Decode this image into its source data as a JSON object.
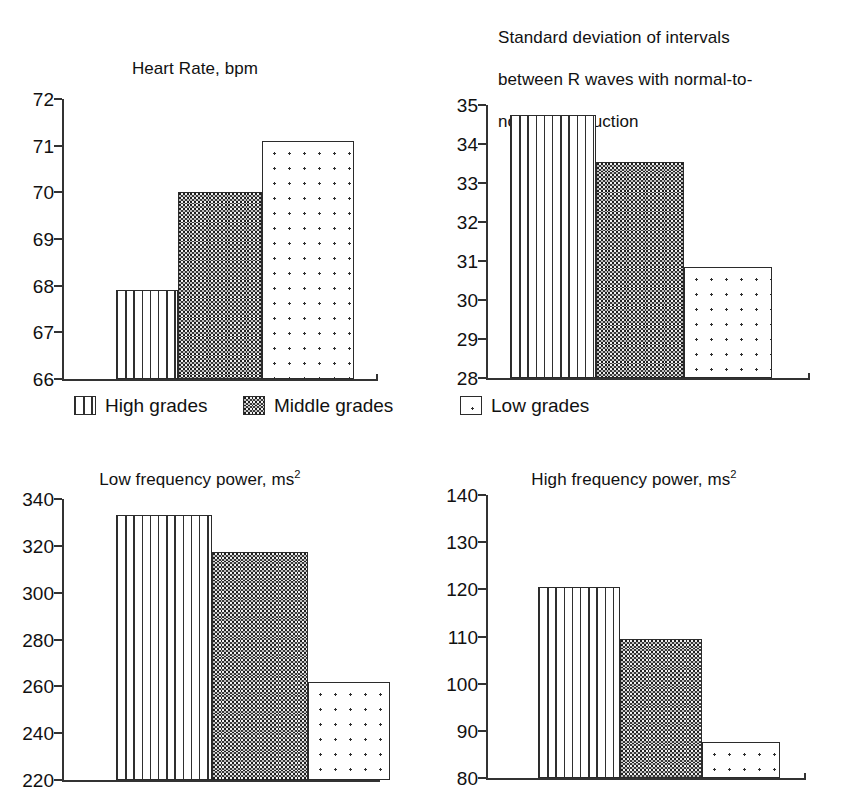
{
  "figure": {
    "legend": {
      "items": [
        {
          "label": "High grades",
          "pattern": "vertical-stripes"
        },
        {
          "label": "Middle grades",
          "pattern": "dark-checkerboard"
        },
        {
          "label": "Low grades",
          "pattern": "sparse-dots"
        }
      ]
    }
  },
  "chart_data": [
    {
      "id": "heart-rate",
      "type": "bar",
      "title": "Heart Rate, bpm",
      "title_plain": "Heart Rate, bpm",
      "xlabel": "",
      "ylabel": "",
      "ylim": [
        66,
        72
      ],
      "yticks": [
        72,
        71,
        70,
        69,
        68,
        67,
        66
      ],
      "grid": false,
      "categories": [
        "High grades",
        "Middle grades",
        "Low grades"
      ],
      "values": [
        67.9,
        70.0,
        71.1
      ]
    },
    {
      "id": "sdnn",
      "type": "bar",
      "title": "Standard deviation of intervals between R waves with normal-to-normal conduction",
      "title_lines": [
        "Standard deviation of intervals",
        "between R waves with normal-to-",
        "normal conduction"
      ],
      "xlabel": "",
      "ylabel": "",
      "ylim": [
        28,
        35
      ],
      "yticks": [
        35,
        34,
        33,
        32,
        31,
        30,
        29,
        28
      ],
      "grid": false,
      "categories": [
        "High grades",
        "Middle grades",
        "Low grades"
      ],
      "values": [
        34.75,
        33.55,
        30.85
      ]
    },
    {
      "id": "low-frequency-power",
      "type": "bar",
      "title": "Low frequency power, ms2",
      "title_prefix": "Low frequency power, ms",
      "title_superscript": "2",
      "xlabel": "",
      "ylabel": "",
      "ylim": [
        220,
        340
      ],
      "yticks": [
        340,
        320,
        300,
        280,
        260,
        240,
        220
      ],
      "grid": false,
      "categories": [
        "High grades",
        "Middle grades",
        "Low grades"
      ],
      "values": [
        333,
        317.5,
        262
      ]
    },
    {
      "id": "high-frequency-power",
      "type": "bar",
      "title": "High frequency power, ms2",
      "title_prefix": "High frequency power, ms",
      "title_superscript": "2",
      "xlabel": "",
      "ylabel": "",
      "ylim": [
        80,
        140
      ],
      "yticks": [
        140,
        130,
        120,
        110,
        100,
        90,
        80
      ],
      "grid": false,
      "categories": [
        "High grades",
        "Middle grades",
        "Low grades"
      ],
      "values": [
        120.5,
        109.5,
        87.7
      ]
    }
  ]
}
